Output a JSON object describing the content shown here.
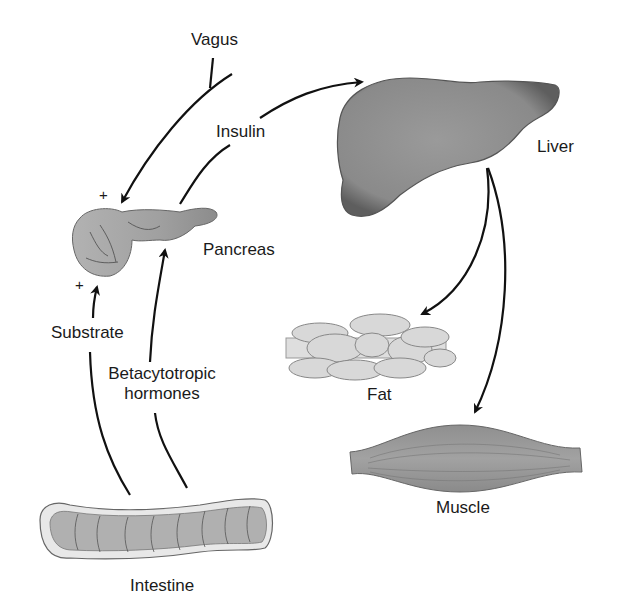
{
  "diagram": {
    "type": "physiology-flow",
    "organs": {
      "liver": "Liver",
      "pancreas": "Pancreas",
      "fat": "Fat",
      "muscle": "Muscle",
      "intestine": "Intestine"
    },
    "signals": {
      "vagus": "Vagus",
      "insulin": "Insulin",
      "substrate": "Substrate",
      "betacytotropic_line1": "Betacytotropic",
      "betacytotropic_line2": "hormones"
    },
    "signs": {
      "vagus_effect": "+",
      "substrate_effect": "+"
    },
    "colors": {
      "organ_dark": "#7a7a7a",
      "organ_mid": "#9a9a9a",
      "organ_light": "#d6d6d6",
      "arrow": "#111111"
    },
    "edges": [
      {
        "from": "vagus",
        "to": "pancreas",
        "sign": "+"
      },
      {
        "from": "pancreas",
        "to": "liver",
        "label": "insulin"
      },
      {
        "from": "liver",
        "to": "fat"
      },
      {
        "from": "liver",
        "to": "muscle"
      },
      {
        "from": "intestine",
        "to": "pancreas",
        "label": "substrate",
        "sign": "+"
      },
      {
        "from": "intestine",
        "to": "pancreas",
        "label": "betacytotropic hormones"
      }
    ]
  }
}
